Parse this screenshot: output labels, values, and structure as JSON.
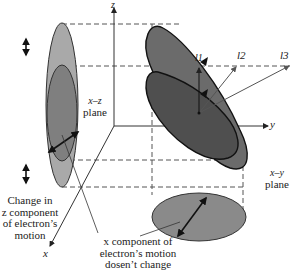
{
  "diagram": {
    "axes": {
      "z_label": "z",
      "y_label": "y",
      "x_label": "x"
    },
    "vectors": {
      "l1_label": "l1",
      "l2_label": "l2",
      "l3_label": "l3"
    },
    "planes": {
      "xz_label_line1": "x–z",
      "xz_label_line2": "plane",
      "xy_label_line1": "x–y",
      "xy_label_line2": "plane"
    },
    "annotations": {
      "z_change_line1": "Change in",
      "z_change_line2": "z component",
      "z_change_line3": "of electron’s",
      "z_change_line4": "motion",
      "x_const_line1": "x component of",
      "x_const_line2": "electron’s motion",
      "x_const_line3": "dosen’t change"
    },
    "colors": {
      "light_gray": "#a9a9a9",
      "mid_gray": "#7a7a7a",
      "dark_gray": "#5a5a5a",
      "darker_gray": "#4a4a4a",
      "outline": "#1a1a1a"
    }
  }
}
